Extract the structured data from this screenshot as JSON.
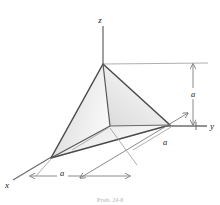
{
  "figure": {
    "type": "3d-geometry-diagram",
    "background_color": "#ffffff",
    "line_color": "#3a3a3a",
    "axis_color": "#6e6e6e",
    "dim_line_color": "#8a8a8a",
    "face_light": "#f4f4f4",
    "face_mid": "#dcdcdc",
    "face_dark": "#b8b8b8"
  },
  "axes": {
    "z": {
      "label": "z"
    },
    "y": {
      "label": "y"
    },
    "x": {
      "label": "x"
    }
  },
  "dimensions": {
    "vertical": {
      "label": "a"
    },
    "depth": {
      "label": "a"
    },
    "horizontal": {
      "label": "a"
    }
  },
  "caption": {
    "text": "Prob. 24-8"
  }
}
